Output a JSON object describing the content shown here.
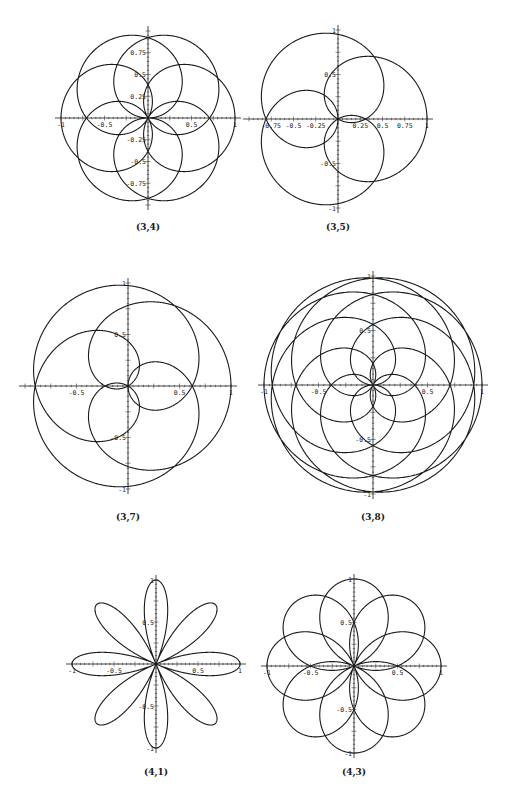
{
  "figure": {
    "line_color": "#1a1a1a",
    "background": "#ffffff"
  },
  "chart_data": [
    {
      "type": "line",
      "subtype": "polar-rose",
      "title": "(3,4)",
      "p": 3,
      "q": 4,
      "center": [
        148,
        118
      ],
      "radius": 87,
      "xlim": [
        -1,
        1
      ],
      "ylim": [
        -1,
        1
      ],
      "x_ticks": [
        "-1",
        "-0.5",
        "0.5",
        "1"
      ],
      "y_ticks": [
        "0.75",
        "0.5",
        "0.25",
        "-0.25",
        "-0.5",
        "-0.75"
      ],
      "grid": false
    },
    {
      "type": "line",
      "subtype": "polar-rose",
      "title": "(3,5)",
      "p": 3,
      "q": 5,
      "center": [
        338,
        119
      ],
      "radius": 89,
      "xlim": [
        -1,
        1
      ],
      "ylim": [
        -1,
        1
      ],
      "x_ticks": [
        "-0.75",
        "-0.5",
        "-0.25",
        "0.25",
        "0.5",
        "0.75",
        "1"
      ],
      "y_ticks": [
        "1",
        "0.5",
        "-0.5",
        "-1"
      ],
      "grid": false
    },
    {
      "type": "line",
      "subtype": "polar-rose",
      "title": "(3,7)",
      "p": 3,
      "q": 7,
      "center": [
        128,
        386
      ],
      "radius": 103,
      "xlim": [
        -1,
        1
      ],
      "ylim": [
        -1,
        1
      ],
      "x_ticks": [
        "-0.5",
        "0.5",
        "1"
      ],
      "y_ticks": [
        "1",
        "0.5",
        "-0.5",
        "-1"
      ],
      "grid": false
    },
    {
      "type": "line",
      "subtype": "polar-rose",
      "title": "(3,8)",
      "p": 3,
      "q": 8,
      "center": [
        373,
        385
      ],
      "radius": 109,
      "xlim": [
        -1,
        1
      ],
      "ylim": [
        -1,
        1
      ],
      "x_ticks": [
        "-1",
        "-0.5",
        "0.5",
        "1"
      ],
      "y_ticks": [
        "1",
        "0.5",
        "-0.5",
        "-1"
      ],
      "grid": false
    },
    {
      "type": "line",
      "subtype": "polar-rose",
      "title": "(4,1)",
      "p": 4,
      "q": 1,
      "center": [
        156,
        664
      ],
      "radius": 84,
      "xlim": [
        -1,
        1
      ],
      "ylim": [
        -1,
        1
      ],
      "x_ticks": [
        "-1",
        "-0.5",
        "0.5",
        "1"
      ],
      "y_ticks": [
        "1",
        "0.5",
        "-0.5",
        "-1"
      ],
      "grid": false
    },
    {
      "type": "line",
      "subtype": "polar-rose",
      "title": "(4,3)",
      "p": 4,
      "q": 3,
      "center": [
        354,
        666
      ],
      "radius": 87,
      "xlim": [
        -1,
        1
      ],
      "ylim": [
        -1,
        1
      ],
      "x_ticks": [
        "-1",
        "-0.5",
        "0.5",
        "1"
      ],
      "y_ticks": [
        "1",
        "0.5",
        "-0.5",
        "-1"
      ],
      "grid": false
    }
  ],
  "captions": [
    {
      "text": "(3,4)",
      "x": 148,
      "y": 222
    },
    {
      "text": "(3,5)",
      "x": 338,
      "y": 222
    },
    {
      "text": "(3,7)",
      "x": 128,
      "y": 512
    },
    {
      "text": "(3,8)",
      "x": 373,
      "y": 512
    },
    {
      "text": "(4,1)",
      "x": 156,
      "y": 767
    },
    {
      "text": "(4,3)",
      "x": 354,
      "y": 767
    }
  ]
}
